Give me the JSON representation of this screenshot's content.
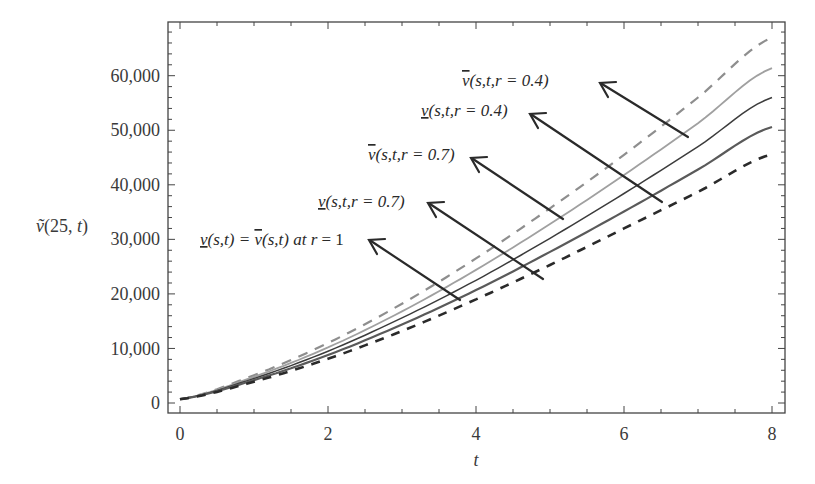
{
  "chart_data": {
    "type": "line",
    "title": "",
    "xlabel": "t",
    "ylabel": "ṽ(25, t)",
    "xlim": [
      0,
      8
    ],
    "ylim": [
      0,
      68000
    ],
    "x_ticks": [
      "0",
      "2",
      "4",
      "6",
      "8"
    ],
    "y_ticks": [
      "0",
      "10,000",
      "20,000",
      "30,000",
      "40,000",
      "50,000",
      "60,000"
    ],
    "grid": false,
    "legend": "annotations with arrows",
    "x": [
      0,
      1,
      2,
      3,
      4,
      5,
      6,
      7,
      8
    ],
    "series": [
      {
        "name": "v̄(s,t,r=0.4)",
        "style": "dashed-gray",
        "color": "#8a8a8a",
        "values": [
          700,
          5100,
          11000,
          18200,
          26500,
          35700,
          45500,
          56000,
          67000
        ]
      },
      {
        "name": "v(s,t,r=0.4)",
        "style": "solid-lightgray",
        "color": "#9a9a9a",
        "values": [
          700,
          4800,
          10200,
          16800,
          24400,
          32800,
          41800,
          51300,
          61400
        ]
      },
      {
        "name": "v̄(s,t,r=0.7)",
        "style": "solid-dark",
        "color": "#3a3a3a",
        "values": [
          700,
          4500,
          9500,
          15600,
          22500,
          30200,
          38400,
          47000,
          56000
        ]
      },
      {
        "name": "v(s,t,r=0.7)",
        "style": "solid-medium",
        "color": "#555555",
        "values": [
          700,
          4200,
          8800,
          14400,
          20700,
          27700,
          35100,
          42800,
          50600
        ]
      },
      {
        "name": "v(s,t)=v̄(s,t) at r=1",
        "style": "dashed-black",
        "color": "#2a2a2a",
        "values": [
          700,
          3900,
          8100,
          13200,
          19000,
          25300,
          32000,
          38700,
          45600
        ]
      }
    ],
    "annotations": [
      {
        "text_main": "v̄(s,t,r",
        "eq": " = 0.4)",
        "points_to_series": 0
      },
      {
        "text_main": "v(s,t,r",
        "eq": " = 0.4)",
        "points_to_series": 1
      },
      {
        "text_main": "v̄(s,t,r",
        "eq": " = 0.7)",
        "points_to_series": 2
      },
      {
        "text_main": "v(s,t,r",
        "eq": " = 0.7)",
        "points_to_series": 3
      },
      {
        "text_main": "v(s,t) = v̄(s,t) at r",
        "eq": " = 1",
        "points_to_series": 4
      }
    ]
  },
  "labels": {
    "ylabel_prefix": "ṽ",
    "ylabel_args": "(25, ",
    "ylabel_var": "t",
    "ylabel_close": ")",
    "xlabel": "t",
    "x0": "0",
    "x2": "2",
    "x4": "4",
    "x6": "6",
    "x8": "8",
    "y0": "0",
    "y10": "10,000",
    "y20": "20,000",
    "y30": "30,000",
    "y40": "40,000",
    "y50": "50,000",
    "y60": "60,000"
  },
  "annot_text": {
    "a1_v": "v",
    "a1_rest": "(s,t,r = 0.4)",
    "a2_v": "v",
    "a2_rest": "(s,t,r = 0.4)",
    "a3_v": "v",
    "a3_rest": "(s,t,r = 0.7)",
    "a4_v": "v",
    "a4_rest": "(s,t,r = 0.7)",
    "a5_v1": "v",
    "a5_mid": "(s,t) = ",
    "a5_v2": "v",
    "a5_mid2": "(s,t) at ",
    "a5_r": "r",
    "a5_end": " = 1"
  }
}
